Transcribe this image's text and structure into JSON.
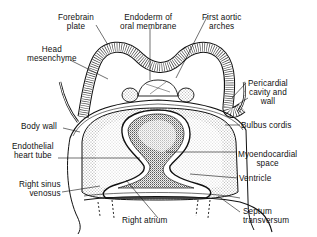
{
  "figure": {
    "labels": {
      "forebrain_plate": [
        "Forebrain",
        "plate"
      ],
      "endoderm_oral_membrane": [
        "Endoderm of",
        "oral membrane"
      ],
      "first_aortic_arches": [
        "First aortic",
        "arches"
      ],
      "head_mesenchyme": [
        "Head",
        "mesenchyme"
      ],
      "pericardial_cavity_wall": [
        "Pericardial",
        "cavity and",
        "wall"
      ],
      "body_wall": "Body wall",
      "bulbus_cordis": "Bulbus cordis",
      "endothelial_heart_tube": [
        "Endothelial",
        "heart tube"
      ],
      "myoendocardial_space": [
        "Myoendocardial",
        "space"
      ],
      "ventricle": "Ventricle",
      "right_sinus_venosus": [
        "Right sinus",
        "venosus"
      ],
      "right_atrium": "Right atrium",
      "septum_transversum": [
        "Septum",
        "transversum"
      ]
    },
    "colors": {
      "ink": "#111111",
      "background": "#ffffff"
    }
  }
}
